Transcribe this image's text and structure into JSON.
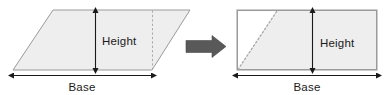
{
  "figure": {
    "background_color": "#ffffff",
    "shape_fill_color": "#eeeeee",
    "shape_stroke_color": "#999999",
    "dashed_line_color": "#aaaaaa",
    "arrow_color": "#595959",
    "dimension_line_color": "#1a1a1a",
    "text_color": "#1a1a1a"
  },
  "left_shape": {
    "name": "parallelogram",
    "height_label": "Height",
    "base_label": "Base",
    "points": "13,70 53,10 190,10 152,70",
    "dashed_cut_line": {
      "x1": 152,
      "y1": 10,
      "x2": 152,
      "y2": 70
    },
    "height_measure": {
      "x": 95,
      "y1": 12,
      "y2": 69,
      "value_label": "Height"
    },
    "base_measure": {
      "y": 75,
      "x1": 13,
      "x2": 152,
      "value_label": "Base"
    },
    "height_text_pos": {
      "x": 113,
      "y": 45
    },
    "base_text_pos": {
      "x": 82,
      "y": 90
    }
  },
  "transform_arrow": {
    "name": "right-arrow",
    "label": "transforms into",
    "x": 186,
    "y": 46,
    "length": 40,
    "color": "#595959"
  },
  "right_shape": {
    "name": "rectangle",
    "height_label": "Height",
    "base_label": "Base",
    "points": "237,10 377,10 377,70 237,70",
    "shaded_region": "237,70 277,10 377,10 377,70",
    "dotted_cut_line": {
      "x1": 237,
      "y1": 70,
      "x2": 277,
      "y2": 10
    },
    "height_measure": {
      "x": 312,
      "y1": 12,
      "y2": 69,
      "value_label": "Height"
    },
    "base_measure": {
      "y": 75,
      "x1": 237,
      "x2": 377,
      "value_label": "Base"
    },
    "height_text_pos": {
      "x": 335,
      "y": 47
    },
    "base_text_pos": {
      "x": 307,
      "y": 90
    }
  }
}
